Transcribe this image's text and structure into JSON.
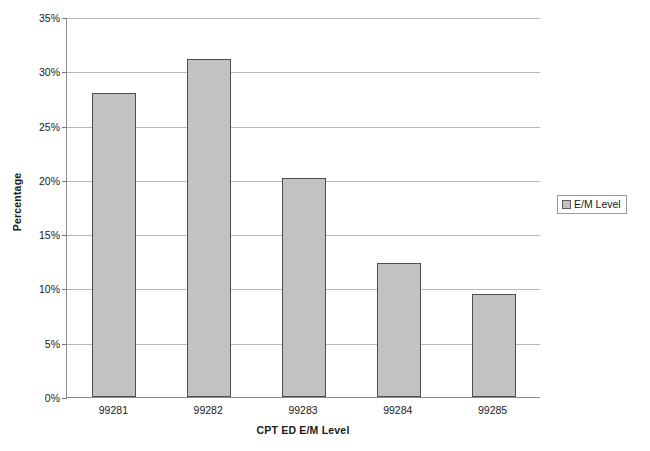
{
  "chart_data": {
    "type": "bar",
    "title": "",
    "categories": [
      "99281",
      "99282",
      "99283",
      "99284",
      "99285"
    ],
    "values": [
      28.0,
      31.1,
      20.2,
      12.3,
      9.5
    ],
    "value_labels": [
      "28.0%",
      "31.1%",
      "20.2%",
      "12.3%",
      "9.5%"
    ],
    "series": [
      {
        "name": "E/M Level",
        "values": [
          28.0,
          31.1,
          20.2,
          12.3,
          9.5
        ]
      }
    ],
    "xlabel": "CPT ED E/M Level",
    "ylabel": "Percentage",
    "ylim": [
      0,
      35
    ],
    "ytick_labels": [
      "0%",
      "5%",
      "10%",
      "15%",
      "20%",
      "25%",
      "30%",
      "35%"
    ],
    "ytick_values": [
      0,
      5,
      10,
      15,
      20,
      25,
      30,
      35
    ],
    "grid": true,
    "legend_position": "right",
    "legend_entries": [
      "E/M Level"
    ],
    "bar_fill_color": "#c2c2c2",
    "bar_border_color": "#4d4d4d",
    "gridline_color": "#b8b8b8",
    "axis_color": "#8c8c8c",
    "background_color": "#ffffff"
  }
}
